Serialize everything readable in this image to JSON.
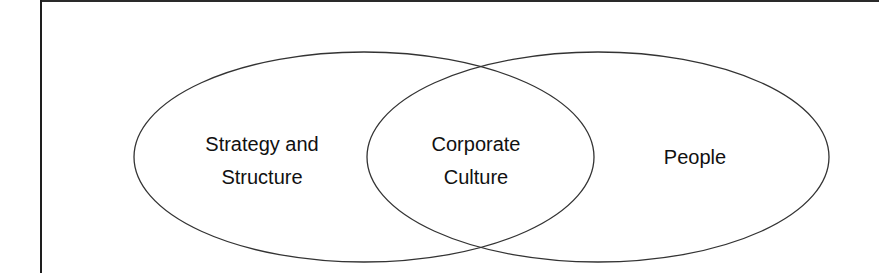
{
  "diagram": {
    "type": "venn",
    "colors": {
      "stroke": "#333333",
      "text": "#111111",
      "background": "#ffffff",
      "frame": "#222222"
    },
    "sets": [
      {
        "id": "strategy-structure",
        "label_line1": "Strategy and",
        "label_line2": "Structure"
      },
      {
        "id": "people",
        "label_line1": "People"
      }
    ],
    "intersection": {
      "id": "corporate-culture",
      "label_line1": "Corporate",
      "label_line2": "Culture"
    }
  }
}
